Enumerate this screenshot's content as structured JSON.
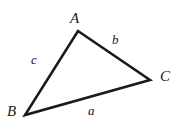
{
  "figure": {
    "kind": "geometry-diagram",
    "shape": "triangle",
    "background_color": "#ffffff",
    "stroke_color": "#1a1a1a",
    "label_color": "#1a1a1a",
    "stroke_width": 2.6,
    "width": 183,
    "height": 130,
    "vertices": [
      {
        "name": "A",
        "label": "A",
        "x": 78,
        "y": 31
      },
      {
        "name": "B",
        "label": "B",
        "x": 25,
        "y": 115
      },
      {
        "name": "C",
        "label": "C",
        "x": 150,
        "y": 80
      }
    ],
    "sides": [
      {
        "name": "a",
        "label": "a",
        "from": "B",
        "to": "C",
        "opposite_vertex": "A"
      },
      {
        "name": "b",
        "label": "b",
        "from": "A",
        "to": "C",
        "opposite_vertex": "B"
      },
      {
        "name": "c",
        "label": "c",
        "from": "A",
        "to": "B",
        "opposite_vertex": "C"
      }
    ],
    "polygon_points": "78,31 150,80 25,115"
  }
}
